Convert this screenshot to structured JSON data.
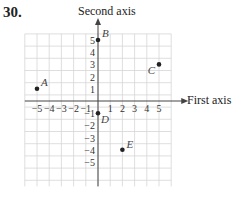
{
  "problem_number": "30.",
  "axes": {
    "y_label": "Second axis",
    "x_label": "First axis",
    "x_ticks": [
      "−5",
      "−4",
      "−3",
      "−2",
      "−1",
      "1",
      "2",
      "3",
      "4",
      "5"
    ],
    "y_ticks": [
      "5",
      "4",
      "3",
      "2",
      "1",
      "−1",
      "−2",
      "−3",
      "−4",
      "−5"
    ]
  },
  "points": [
    {
      "label": "A",
      "x": -5,
      "y": 1
    },
    {
      "label": "B",
      "x": 0,
      "y": 5
    },
    {
      "label": "C",
      "x": 5,
      "y": 3
    },
    {
      "label": "D",
      "x": 0,
      "y": -1
    },
    {
      "label": "E",
      "x": 2,
      "y": -4
    }
  ],
  "colors": {
    "grid": "#d6d6d6",
    "axis": "#444444",
    "point": "#222222"
  }
}
